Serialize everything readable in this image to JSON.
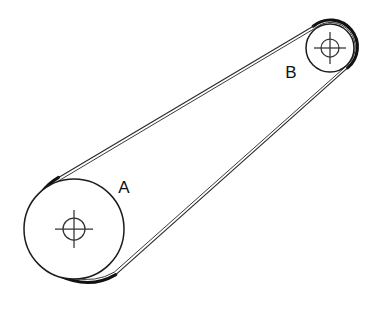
{
  "diagram": {
    "type": "mechanical-engineering-line-drawing",
    "background_color": "#ffffff",
    "line_color": "#111111",
    "belt_color": "#111111",
    "canvas": {
      "width": 373,
      "height": 310
    }
  },
  "pulleys": [
    {
      "id": "A",
      "label": "A",
      "role": "large-pulley",
      "center": {
        "x": 74,
        "y": 229
      },
      "belt_outer_radius": 54,
      "rim_radius": 50,
      "hub_radius": 11,
      "hub_cross_extent": 19,
      "label_position": {
        "x": 124,
        "y": 188
      }
    },
    {
      "id": "B",
      "label": "B",
      "role": "small-pulley",
      "center": {
        "x": 330,
        "y": 48
      },
      "belt_outer_radius": 27,
      "rim_radius": 24,
      "hub_radius": 9,
      "hub_cross_extent": 16,
      "label_position": {
        "x": 291,
        "y": 73
      }
    }
  ],
  "belt": {
    "configuration": "open",
    "upper_span": {
      "from": {
        "x": 58,
        "y": 176
      },
      "to": {
        "x": 313,
        "y": 25
      }
    },
    "lower_span": {
      "from": {
        "x": 116,
        "y": 275
      },
      "to": {
        "x": 348,
        "y": 68
      }
    },
    "stroke_width": 3.1
  },
  "labels": {
    "pulley_a": "A",
    "pulley_b": "B"
  }
}
